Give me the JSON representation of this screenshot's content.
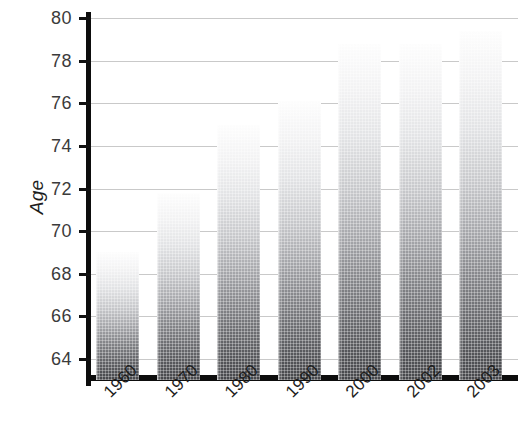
{
  "chart_data": {
    "type": "bar",
    "title": "",
    "xlabel": "",
    "ylabel": "Age",
    "categories": [
      "1960",
      "1970",
      "1980",
      "1990",
      "2000",
      "2002",
      "2003"
    ],
    "values": [
      69.0,
      71.8,
      75.0,
      76.1,
      78.8,
      78.8,
      79.4
    ],
    "series": [
      {
        "name": "Age",
        "values": [
          69.0,
          71.8,
          75.0,
          76.1,
          78.8,
          78.8,
          79.4
        ]
      }
    ],
    "ylim": [
      63.0,
      80.3
    ],
    "yticks": [
      64,
      66,
      68,
      70,
      72,
      74,
      76,
      78,
      80
    ],
    "ytick_labels": [
      "64",
      "66",
      "68",
      "70",
      "72",
      "74",
      "76",
      "78",
      "80"
    ],
    "grid": true,
    "legend": null,
    "legend_position": "none",
    "xtick_rotation": -45,
    "bar_fill": "vertical gradient white-to-dark-gray",
    "bar_color_top": "#fdfdfd",
    "bar_color_bottom": "#46474b",
    "axis_color": "#0d0d0d",
    "gridline_color": "#c9c9c9"
  }
}
